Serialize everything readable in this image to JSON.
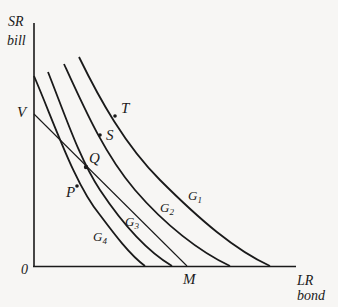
{
  "diagram": {
    "type": "indifference-curves-with-budget-line",
    "y_axis": {
      "line1": "SR",
      "line2": "bill"
    },
    "x_axis": {
      "line1": "LR",
      "line2": "bond"
    },
    "origin_label": "0",
    "budget_line": {
      "start_label": "V",
      "end_label": "M"
    },
    "curves": [
      {
        "id": "G1",
        "letter": "G",
        "sub": "1"
      },
      {
        "id": "G2",
        "letter": "G",
        "sub": "2"
      },
      {
        "id": "G3",
        "letter": "G",
        "sub": "3"
      },
      {
        "id": "G4",
        "letter": "G",
        "sub": "4"
      }
    ],
    "points": [
      {
        "label": "T",
        "on": "G1"
      },
      {
        "label": "S",
        "on": "G2"
      },
      {
        "label": "Q",
        "on": "G3",
        "note": "tangency with budget line VM"
      },
      {
        "label": "P",
        "on": "G4"
      }
    ],
    "colors": {
      "ink": "#1a1a1a",
      "background": "#f7f6f4"
    }
  }
}
